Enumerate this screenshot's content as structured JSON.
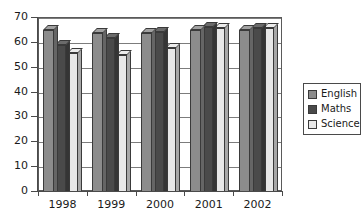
{
  "chart_data": {
    "type": "bar",
    "title": "",
    "xlabel": "",
    "ylabel": "",
    "categories": [
      "1998",
      "1999",
      "2000",
      "2001",
      "2002"
    ],
    "series": [
      {
        "name": "English",
        "color": "#8c8c8c",
        "values": [
          65,
          64,
          64,
          65,
          65
        ]
      },
      {
        "name": "Maths",
        "color": "#4a4a4a",
        "values": [
          59,
          62,
          64.5,
          66.5,
          66
        ]
      },
      {
        "name": "Science",
        "color": "#e8e8e8",
        "values": [
          56,
          55,
          58,
          66,
          66
        ]
      }
    ],
    "ylim": [
      0,
      70
    ],
    "yticks": [
      0,
      10,
      20,
      30,
      40,
      50,
      60,
      70
    ],
    "ytick_labels": [
      "0",
      "10",
      "20",
      "30",
      "40",
      "50",
      "60",
      "70"
    ],
    "grid": true,
    "legend_position": "right",
    "style": "3d-grouped-bars"
  },
  "legend": {
    "items": [
      {
        "label": "English",
        "color": "#8c8c8c"
      },
      {
        "label": "Maths",
        "color": "#4a4a4a"
      },
      {
        "label": "Science",
        "color": "#e8e8e8"
      }
    ]
  },
  "axes": {
    "y_tick_labels": [
      "70",
      "60",
      "50",
      "40",
      "30",
      "20",
      "10",
      "0"
    ],
    "x_tick_labels": [
      "1998",
      "1999",
      "2000",
      "2001",
      "2002"
    ]
  }
}
